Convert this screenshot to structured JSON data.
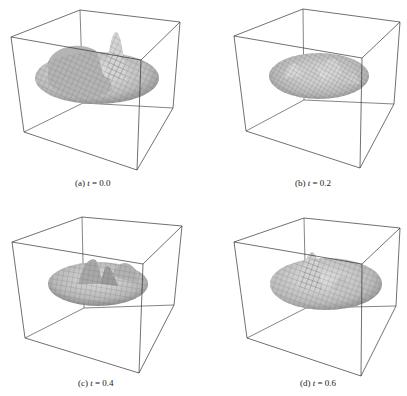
{
  "figure": {
    "panels": [
      {
        "label": "(a)",
        "var": "t",
        "eq": "= 0.0",
        "t": 0.0
      },
      {
        "label": "(b)",
        "var": "t",
        "eq": "= 0.2",
        "t": 0.2
      },
      {
        "label": "(c)",
        "var": "t",
        "eq": "= 0.4",
        "t": 0.4
      },
      {
        "label": "(d)",
        "var": "t",
        "eq": "= 0.6",
        "t": 0.6
      }
    ],
    "colors": {
      "box": "#333333",
      "surface": "#c8c8c8",
      "surface_dark": "#8e8e8e",
      "mesh": "#6a6a6a"
    }
  }
}
